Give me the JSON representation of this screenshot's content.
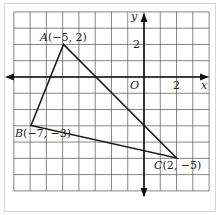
{
  "axes": {
    "x_label": "x",
    "y_label": "y",
    "origin_label": "O",
    "x_tick_label": "2",
    "y_tick_label": "2",
    "x_range": [
      -8,
      4
    ],
    "y_range": [
      -7,
      4
    ]
  },
  "points": [
    {
      "name": "A",
      "coords": "(−5, 2)",
      "label": "A(−5, 2)",
      "x": -5,
      "y": 2
    },
    {
      "name": "B",
      "coords": "(−7, −3)",
      "label": "B(−7, −3)",
      "x": -7,
      "y": -3
    },
    {
      "name": "C",
      "coords": "(2, −5)",
      "label": "C(2, −5)",
      "x": 2,
      "y": -5
    }
  ],
  "colors": {
    "grid": "#555555",
    "line": "#1a1a1a",
    "background": "#ffffff"
  }
}
